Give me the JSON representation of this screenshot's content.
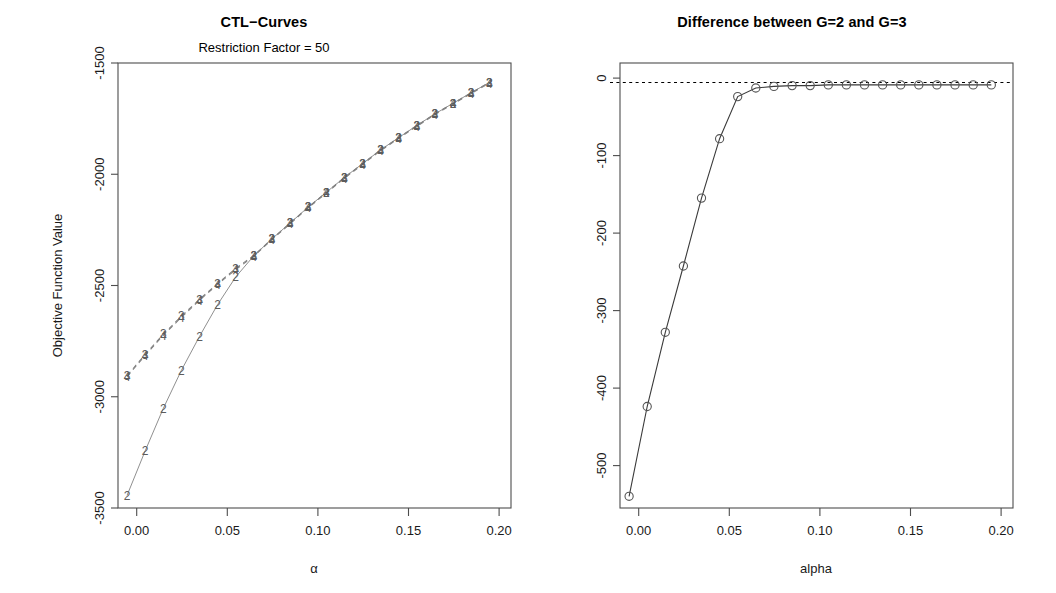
{
  "figure": {
    "width": 1056,
    "height": 593,
    "background": "#ffffff",
    "foreground": "#000000"
  },
  "panels": [
    {
      "name": "ctl-curves",
      "title": "CTL−Curves",
      "subtitle": "Restriction Factor = 50",
      "xlabel": "α",
      "ylabel": "Objective Function Value",
      "x_ticks": [
        "0.00",
        "0.05",
        "0.10",
        "0.15",
        "0.20"
      ],
      "y_ticks": [
        "-3500",
        "-3000",
        "-2500",
        "-2000",
        "-1500"
      ]
    },
    {
      "name": "difference-g2-g3",
      "title": "Difference between G=2 and G=3",
      "subtitle": "",
      "xlabel": "alpha",
      "ylabel": "",
      "x_ticks": [
        "0.00",
        "0.05",
        "0.10",
        "0.15",
        "0.20"
      ],
      "y_ticks": [
        "-500",
        "-400",
        "-300",
        "-200",
        "-100",
        "0"
      ]
    }
  ],
  "chart_data": [
    {
      "type": "line",
      "name": "ctl-curves",
      "title": "CTL−Curves",
      "subtitle": "Restriction Factor = 50",
      "xlabel": "α",
      "ylabel": "Objective Function Value",
      "xlim": [
        -0.005,
        0.212
      ],
      "ylim": [
        -3560,
        -1460
      ],
      "x_ticks": [
        0.0,
        0.05,
        0.1,
        0.15,
        0.2
      ],
      "x_tick_labels": [
        "0.00",
        "0.05",
        "0.10",
        "0.15",
        "0.20"
      ],
      "y_ticks": [
        -3500,
        -3000,
        -2500,
        -2000,
        -1500
      ],
      "y_tick_labels": [
        "-3500",
        "-3000",
        "-2500",
        "-2000",
        "-1500"
      ],
      "grid": false,
      "legend": "none",
      "point_marker": "digit-label",
      "x": [
        0.0,
        0.01,
        0.02,
        0.03,
        0.04,
        0.05,
        0.06,
        0.07,
        0.08,
        0.09,
        0.1,
        0.11,
        0.12,
        0.13,
        0.14,
        0.15,
        0.16,
        0.17,
        0.18,
        0.19,
        0.2
      ],
      "series": [
        {
          "name": "G=2",
          "marker_label": "2",
          "line_style": "solid",
          "color": "#909090",
          "values": [
            -3500,
            -3290,
            -3090,
            -2910,
            -2750,
            -2600,
            -2470,
            -2370,
            -2290,
            -2215,
            -2140,
            -2070,
            -2000,
            -1935,
            -1870,
            -1812,
            -1755,
            -1700,
            -1650,
            -1600,
            -1552
          ]
        },
        {
          "name": "G=3",
          "marker_label": "3",
          "line_style": "dashed",
          "color": "#808080",
          "values": [
            -2935,
            -2835,
            -2740,
            -2655,
            -2575,
            -2500,
            -2430,
            -2368,
            -2290,
            -2215,
            -2140,
            -2070,
            -2000,
            -1935,
            -1870,
            -1812,
            -1755,
            -1700,
            -1650,
            -1600,
            -1552
          ]
        },
        {
          "name": "G=4",
          "marker_label": "4",
          "line_style": "dashed",
          "color": "#808080",
          "values": [
            -2940,
            -2840,
            -2745,
            -2660,
            -2580,
            -2505,
            -2435,
            -2372,
            -2294,
            -2219,
            -2144,
            -2074,
            -2004,
            -1939,
            -1874,
            -1816,
            -1759,
            -1704,
            -1654,
            -1604,
            -1556
          ]
        }
      ]
    },
    {
      "type": "line",
      "name": "difference-g2-g3",
      "title": "Difference between G=2 and G=3",
      "xlabel": "alpha",
      "ylabel": "",
      "xlim": [
        -0.005,
        0.212
      ],
      "ylim": [
        -545,
        25
      ],
      "x_ticks": [
        0.0,
        0.05,
        0.1,
        0.15,
        0.2
      ],
      "x_tick_labels": [
        "0.00",
        "0.05",
        "0.10",
        "0.15",
        "0.20"
      ],
      "y_ticks": [
        -500,
        -400,
        -300,
        -200,
        -100,
        0
      ],
      "y_tick_labels": [
        "-500",
        "-400",
        "-300",
        "-200",
        "-100",
        "0"
      ],
      "grid": false,
      "legend": "none",
      "point_marker": "open-circle",
      "reference_line": {
        "y": 0,
        "style": "dotted",
        "color": "#000000"
      },
      "x": [
        0.0,
        0.01,
        0.02,
        0.03,
        0.04,
        0.05,
        0.06,
        0.07,
        0.08,
        0.09,
        0.1,
        0.11,
        0.12,
        0.13,
        0.14,
        0.15,
        0.16,
        0.17,
        0.18,
        0.19,
        0.2
      ],
      "values": [
        -530,
        -415,
        -320,
        -235,
        -148,
        -72,
        -18,
        -7,
        -5,
        -4,
        -4,
        -3,
        -3,
        -3,
        -3,
        -3,
        -3,
        -3,
        -3,
        -3,
        -3
      ]
    }
  ]
}
